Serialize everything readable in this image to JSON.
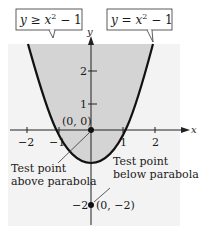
{
  "figure": {
    "type": "graph-of-inequality",
    "axes": {
      "x_label": "x",
      "y_label": "y",
      "x_ticks": [
        {
          "value": -2,
          "label": "−2"
        },
        {
          "value": -1,
          "label": "−1"
        },
        {
          "value": 1,
          "label": "1"
        },
        {
          "value": 2,
          "label": "2"
        }
      ],
      "y_ticks": [
        {
          "value": 2,
          "label": "2"
        },
        {
          "value": 1,
          "label": "1"
        },
        {
          "value": -2,
          "label": "−2"
        }
      ],
      "x_range": [
        -2.6,
        2.8
      ],
      "y_range": [
        -2.9,
        2.6
      ]
    },
    "callouts": {
      "inequality": "y ≥ x² − 1",
      "inequality_parts": {
        "lhs": "y",
        "op": " ≥ ",
        "base": "x",
        "exp": "2",
        "rest": " − 1"
      },
      "equation": "y = x² − 1",
      "equation_parts": {
        "lhs": "y",
        "op": " = ",
        "base": "x",
        "exp": "2",
        "rest": " − 1"
      }
    },
    "points": [
      {
        "label": "(0,  0)",
        "x": 0,
        "y": 0
      },
      {
        "label": "(0,  −2)",
        "x": 0,
        "y": -2
      }
    ],
    "annotations": {
      "above_line1": "Test point",
      "above_line2": "above parabola",
      "below_line1": "Test point",
      "below_line2": "below parabola"
    },
    "colors": {
      "panel_bg": "#f3f3f3",
      "shaded_region": "#d4d4d4",
      "curve": "#111111",
      "axis": "#222222"
    }
  }
}
